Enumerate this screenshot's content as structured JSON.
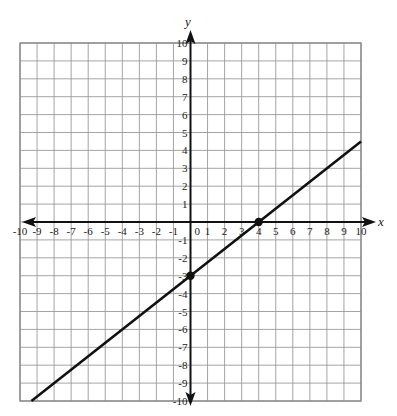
{
  "chart_data": {
    "type": "line",
    "title": "",
    "xlabel": "x",
    "ylabel": "y",
    "xlim": [
      -10,
      10
    ],
    "ylim": [
      -10,
      10
    ],
    "grid": true,
    "x_ticks": [
      -10,
      -9,
      -8,
      -7,
      -6,
      -5,
      -4,
      -3,
      -2,
      -1,
      0,
      1,
      2,
      3,
      4,
      5,
      6,
      7,
      8,
      9,
      10
    ],
    "y_ticks": [
      -10,
      -9,
      -8,
      -7,
      -6,
      -5,
      -4,
      -3,
      -2,
      -1,
      1,
      2,
      3,
      4,
      5,
      6,
      7,
      8,
      9,
      10
    ],
    "series": [
      {
        "name": "line",
        "equation": "y = 0.75x - 3",
        "slope": 0.75,
        "intercept": -3,
        "x": [
          -9.33,
          10
        ],
        "y": [
          -10,
          4.5
        ]
      }
    ],
    "points": [
      {
        "x": 0,
        "y": -3,
        "label": "y-intercept"
      },
      {
        "x": 4,
        "y": 0,
        "label": "x-intercept"
      }
    ]
  },
  "labels": {
    "x_axis": "x",
    "y_axis": "y",
    "origin": "0"
  }
}
